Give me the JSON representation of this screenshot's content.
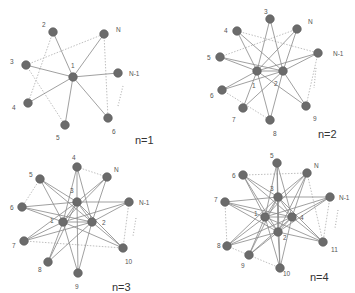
{
  "colors": {
    "node": "#6b6b6b",
    "node_stroke": "#5a5a5a",
    "edge": "#8a8a8a",
    "dotted_edge": "#b8b8b8",
    "label": "#555555",
    "caption": "#333333"
  },
  "panels": [
    {
      "id": "n1",
      "caption": "n=1",
      "caption_pos": [
        135,
        144
      ],
      "nodes": [
        {
          "id": "1",
          "x": 73,
          "y": 77,
          "label": "1",
          "lx": 71,
          "ly": 68
        },
        {
          "id": "2",
          "x": 53,
          "y": 32,
          "label": "2",
          "lx": 42,
          "ly": 27
        },
        {
          "id": "3",
          "x": 26,
          "y": 65,
          "label": "3",
          "lx": 10,
          "ly": 64
        },
        {
          "id": "4",
          "x": 28,
          "y": 103,
          "label": "4",
          "lx": 12,
          "ly": 110
        },
        {
          "id": "5",
          "x": 65,
          "y": 125,
          "label": "5",
          "lx": 56,
          "ly": 140
        },
        {
          "id": "6",
          "x": 108,
          "y": 118,
          "label": "6",
          "lx": 112,
          "ly": 134
        },
        {
          "id": "N-1",
          "x": 118,
          "y": 73,
          "label": "N-1",
          "lx": 129,
          "ly": 76
        },
        {
          "id": "N",
          "x": 104,
          "y": 34,
          "label": "N",
          "lx": 116,
          "ly": 32
        }
      ],
      "edges": [
        [
          "1",
          "2"
        ],
        [
          "1",
          "3"
        ],
        [
          "1",
          "4"
        ],
        [
          "1",
          "5"
        ],
        [
          "1",
          "6"
        ],
        [
          "1",
          "N-1"
        ],
        [
          "1",
          "N"
        ]
      ],
      "dotted_edges": [
        [
          "2",
          "4"
        ],
        [
          "3",
          "5"
        ],
        [
          "3",
          "N"
        ],
        [
          "N",
          "6"
        ]
      ],
      "ellipsis": [
        [
          123,
          86
        ],
        [
          118,
          106
        ]
      ]
    },
    {
      "id": "n2",
      "caption": "n=2",
      "caption_pos": [
        318,
        138
      ],
      "nodes": [
        {
          "id": "1",
          "x": 257,
          "y": 71,
          "label": "1",
          "lx": 252,
          "ly": 88
        },
        {
          "id": "2",
          "x": 283,
          "y": 71,
          "label": "2",
          "lx": 274,
          "ly": 86
        },
        {
          "id": "3",
          "x": 270,
          "y": 19,
          "label": "3",
          "lx": 264,
          "ly": 14
        },
        {
          "id": "4",
          "x": 237,
          "y": 31,
          "label": "4",
          "lx": 224,
          "ly": 33
        },
        {
          "id": "5",
          "x": 220,
          "y": 57,
          "label": "5",
          "lx": 207,
          "ly": 60
        },
        {
          "id": "6",
          "x": 222,
          "y": 90,
          "label": "6",
          "lx": 210,
          "ly": 98
        },
        {
          "id": "7",
          "x": 243,
          "y": 108,
          "label": "7",
          "lx": 232,
          "ly": 122
        },
        {
          "id": "8",
          "x": 270,
          "y": 120,
          "label": "8",
          "lx": 273,
          "ly": 136
        },
        {
          "id": "9",
          "x": 306,
          "y": 106,
          "label": "9",
          "lx": 313,
          "ly": 121
        },
        {
          "id": "N-1",
          "x": 318,
          "y": 53,
          "label": "N-1",
          "lx": 333,
          "ly": 56
        },
        {
          "id": "N",
          "x": 297,
          "y": 29,
          "label": "N",
          "lx": 308,
          "ly": 24
        }
      ],
      "edges": [
        [
          "1",
          "2"
        ],
        [
          "1",
          "3"
        ],
        [
          "1",
          "4"
        ],
        [
          "1",
          "5"
        ],
        [
          "1",
          "6"
        ],
        [
          "1",
          "7"
        ],
        [
          "1",
          "8"
        ],
        [
          "1",
          "9"
        ],
        [
          "1",
          "N-1"
        ],
        [
          "1",
          "N"
        ],
        [
          "2",
          "3"
        ],
        [
          "2",
          "4"
        ],
        [
          "2",
          "5"
        ],
        [
          "2",
          "6"
        ],
        [
          "2",
          "7"
        ],
        [
          "2",
          "8"
        ],
        [
          "2",
          "9"
        ],
        [
          "2",
          "N-1"
        ],
        [
          "2",
          "N"
        ]
      ],
      "dotted_edges": [
        [
          "4",
          "N-1"
        ],
        [
          "5",
          "N"
        ],
        [
          "6",
          "8"
        ],
        [
          "N-1",
          "9"
        ]
      ],
      "ellipsis": [
        [
          316,
          68
        ],
        [
          314,
          88
        ]
      ]
    },
    {
      "id": "n3",
      "caption": "n=3",
      "caption_pos": [
        112,
        291
      ],
      "nodes": [
        {
          "id": "1",
          "x": 63,
          "y": 222,
          "label": "1",
          "lx": 50,
          "ly": 223
        },
        {
          "id": "2",
          "x": 92,
          "y": 222,
          "label": "2",
          "lx": 102,
          "ly": 225
        },
        {
          "id": "3",
          "x": 77,
          "y": 202,
          "label": "3",
          "lx": 70,
          "ly": 193
        },
        {
          "id": "4",
          "x": 77,
          "y": 167,
          "label": "4",
          "lx": 72,
          "ly": 160
        },
        {
          "id": "5",
          "x": 40,
          "y": 179,
          "label": "5",
          "lx": 29,
          "ly": 177
        },
        {
          "id": "6",
          "x": 22,
          "y": 207,
          "label": "6",
          "lx": 10,
          "ly": 210
        },
        {
          "id": "7",
          "x": 24,
          "y": 241,
          "label": "7",
          "lx": 12,
          "ly": 248
        },
        {
          "id": "8",
          "x": 48,
          "y": 262,
          "label": "8",
          "lx": 38,
          "ly": 272
        },
        {
          "id": "9",
          "x": 78,
          "y": 273,
          "label": "9",
          "lx": 75,
          "ly": 289
        },
        {
          "id": "10",
          "x": 123,
          "y": 248,
          "label": "10",
          "lx": 125,
          "ly": 264
        },
        {
          "id": "N-1",
          "x": 129,
          "y": 202,
          "label": "N-1",
          "lx": 139,
          "ly": 205
        },
        {
          "id": "N",
          "x": 107,
          "y": 177,
          "label": "N",
          "lx": 114,
          "ly": 172
        }
      ],
      "edges": [
        [
          "1",
          "2"
        ],
        [
          "1",
          "3"
        ],
        [
          "2",
          "3"
        ],
        [
          "1",
          "4"
        ],
        [
          "1",
          "5"
        ],
        [
          "1",
          "6"
        ],
        [
          "1",
          "7"
        ],
        [
          "1",
          "8"
        ],
        [
          "1",
          "9"
        ],
        [
          "1",
          "10"
        ],
        [
          "1",
          "N-1"
        ],
        [
          "1",
          "N"
        ],
        [
          "2",
          "4"
        ],
        [
          "2",
          "5"
        ],
        [
          "2",
          "6"
        ],
        [
          "2",
          "7"
        ],
        [
          "2",
          "8"
        ],
        [
          "2",
          "9"
        ],
        [
          "2",
          "10"
        ],
        [
          "2",
          "N-1"
        ],
        [
          "2",
          "N"
        ],
        [
          "3",
          "4"
        ],
        [
          "3",
          "5"
        ],
        [
          "3",
          "6"
        ],
        [
          "3",
          "7"
        ],
        [
          "3",
          "8"
        ],
        [
          "3",
          "9"
        ],
        [
          "3",
          "10"
        ],
        [
          "3",
          "N-1"
        ],
        [
          "3",
          "N"
        ]
      ],
      "dotted_edges": [
        [
          "4",
          "N"
        ],
        [
          "5",
          "6"
        ],
        [
          "7",
          "10"
        ],
        [
          "N-1",
          "10"
        ]
      ],
      "ellipsis": [
        [
          136,
          218
        ],
        [
          133,
          236
        ]
      ]
    },
    {
      "id": "n4",
      "caption": "n=4",
      "caption_pos": [
        310,
        281
      ],
      "nodes": [
        {
          "id": "1",
          "x": 265,
          "y": 217,
          "label": "1",
          "lx": 254,
          "ly": 216
        },
        {
          "id": "2",
          "x": 278,
          "y": 232,
          "label": "2",
          "lx": 283,
          "ly": 240
        },
        {
          "id": "3",
          "x": 278,
          "y": 197,
          "label": "3",
          "lx": 270,
          "ly": 191
        },
        {
          "id": "4",
          "x": 292,
          "y": 217,
          "label": "4",
          "lx": 300,
          "ly": 220
        },
        {
          "id": "5",
          "x": 277,
          "y": 163,
          "label": "5",
          "lx": 270,
          "ly": 158
        },
        {
          "id": "6",
          "x": 243,
          "y": 175,
          "label": "6",
          "lx": 232,
          "ly": 178
        },
        {
          "id": "7",
          "x": 225,
          "y": 202,
          "label": "7",
          "lx": 214,
          "ly": 202
        },
        {
          "id": "8",
          "x": 227,
          "y": 246,
          "label": "8",
          "lx": 217,
          "ly": 248
        },
        {
          "id": "9",
          "x": 249,
          "y": 255,
          "label": "9",
          "lx": 241,
          "ly": 268
        },
        {
          "id": "10",
          "x": 280,
          "y": 268,
          "label": "10",
          "lx": 283,
          "ly": 276
        },
        {
          "id": "11",
          "x": 323,
          "y": 242,
          "label": "11",
          "lx": 331,
          "ly": 252
        },
        {
          "id": "N-1",
          "x": 330,
          "y": 197,
          "label": "N-1",
          "lx": 339,
          "ly": 200
        },
        {
          "id": "N",
          "x": 307,
          "y": 173,
          "label": "N",
          "lx": 314,
          "ly": 168
        }
      ],
      "edges": [
        [
          "1",
          "2"
        ],
        [
          "1",
          "3"
        ],
        [
          "1",
          "4"
        ],
        [
          "2",
          "3"
        ],
        [
          "2",
          "4"
        ],
        [
          "3",
          "4"
        ],
        [
          "1",
          "5"
        ],
        [
          "1",
          "6"
        ],
        [
          "1",
          "7"
        ],
        [
          "1",
          "8"
        ],
        [
          "1",
          "9"
        ],
        [
          "1",
          "10"
        ],
        [
          "1",
          "11"
        ],
        [
          "1",
          "N-1"
        ],
        [
          "1",
          "N"
        ],
        [
          "2",
          "5"
        ],
        [
          "2",
          "6"
        ],
        [
          "2",
          "7"
        ],
        [
          "2",
          "8"
        ],
        [
          "2",
          "9"
        ],
        [
          "2",
          "10"
        ],
        [
          "2",
          "11"
        ],
        [
          "2",
          "N-1"
        ],
        [
          "2",
          "N"
        ],
        [
          "3",
          "5"
        ],
        [
          "3",
          "6"
        ],
        [
          "3",
          "7"
        ],
        [
          "3",
          "8"
        ],
        [
          "3",
          "9"
        ],
        [
          "3",
          "10"
        ],
        [
          "3",
          "11"
        ],
        [
          "3",
          "N-1"
        ],
        [
          "3",
          "N"
        ],
        [
          "4",
          "5"
        ],
        [
          "4",
          "6"
        ],
        [
          "4",
          "7"
        ],
        [
          "4",
          "8"
        ],
        [
          "4",
          "9"
        ],
        [
          "4",
          "10"
        ],
        [
          "4",
          "11"
        ],
        [
          "4",
          "N-1"
        ],
        [
          "4",
          "N"
        ]
      ],
      "dotted_edges": [
        [
          "6",
          "N"
        ],
        [
          "7",
          "8"
        ],
        [
          "8",
          "10"
        ],
        [
          "N",
          "11"
        ],
        [
          "N-1",
          "11"
        ]
      ],
      "ellipsis": [
        [
          338,
          210
        ],
        [
          335,
          228
        ]
      ]
    }
  ]
}
